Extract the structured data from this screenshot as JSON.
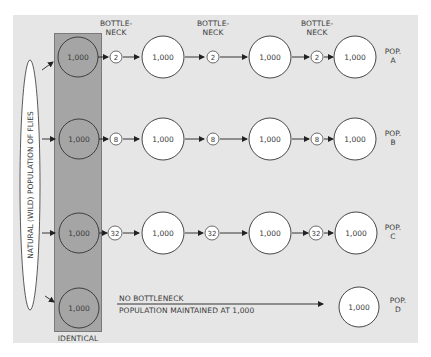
{
  "source_population": {
    "label": "NATURAL (WILD) POPULATION OF FLIES"
  },
  "identical_column": {
    "label": "IDENTICAL",
    "fill_color": "#a5a5a5"
  },
  "bottleneck_headers": [
    "BOTTLE-\nNECK",
    "BOTTLE-\nNECK",
    "BOTTLE-\nNECK"
  ],
  "bottleneck_header_lines": {
    "line1": "BOTTLE-",
    "line2": "NECK"
  },
  "rows": [
    {
      "id": "A",
      "pop_label_line1": "POP.",
      "pop_label_line2": "A",
      "bottleneck_size": "2",
      "population_sizes": [
        "1,000",
        "1,000",
        "1,000",
        "1,000"
      ]
    },
    {
      "id": "B",
      "pop_label_line1": "POP.",
      "pop_label_line2": "B",
      "bottleneck_size": "8",
      "population_sizes": [
        "1,000",
        "1,000",
        "1,000",
        "1,000"
      ]
    },
    {
      "id": "C",
      "pop_label_line1": "POP.",
      "pop_label_line2": "C",
      "bottleneck_size": "32",
      "population_sizes": [
        "1,000",
        "1,000",
        "1,000",
        "1,000"
      ]
    },
    {
      "id": "D",
      "pop_label_line1": "POP.",
      "pop_label_line2": "D",
      "bottleneck_size": null,
      "population_sizes": [
        "1,000",
        "1,000"
      ],
      "annotation_line1": "NO BOTTLENECK",
      "annotation_line2": "POPULATION MAINTAINED AT 1,000"
    }
  ],
  "colors": {
    "panel_background": "#e6e6e6",
    "column_fill": "#a5a5a5",
    "circle_fill": "#ffffff",
    "stroke": "#333333",
    "text": "#3a3a3a"
  }
}
